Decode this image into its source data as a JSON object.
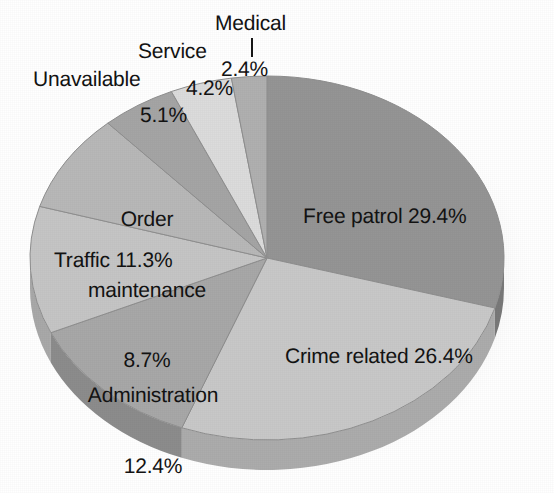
{
  "chart_data": {
    "type": "pie",
    "title": "",
    "subtitle": "",
    "xlabel": "",
    "ylabel": "",
    "legend_position": "none",
    "grid": false,
    "value_unit": "percent",
    "labels": [
      "Free patrol",
      "Crime related",
      "Administration",
      "Traffic",
      "Order maintenance",
      "Unavailable",
      "Service",
      "Medical"
    ],
    "values": [
      29.4,
      26.4,
      12.4,
      11.3,
      8.7,
      5.1,
      4.2,
      2.4
    ],
    "value_labels": [
      "29.4%",
      "26.4%",
      "12.4%",
      "11.3%",
      "8.7%",
      "5.1%",
      "4.2%",
      "2.4%"
    ],
    "colors": [
      "#959595",
      "#c8c8c8",
      "#a8a8a8",
      "#c5c5c5",
      "#b8b8b8",
      "#a5a5a5",
      "#dcdcdc",
      "#b0b0b0"
    ],
    "start_angle_deg": 0,
    "direction": "clockwise",
    "style": "3d-elliptical",
    "background": "#ffffff",
    "text_color": "#131313"
  },
  "slice_labels": {
    "free_patrol": "Free patrol 29.4%",
    "crime_related": "Crime related 26.4%",
    "administration_name": "Administration",
    "administration_pct": "12.4%",
    "traffic": "Traffic 11.3%",
    "order_line1": "Order",
    "order_line2": "maintenance",
    "order_pct": "8.7%",
    "unavailable_name": "Unavailable",
    "unavailable_pct": "5.1%",
    "service_name": "Service",
    "service_pct": "4.2%",
    "medical_name": "Medical",
    "medical_pct": "2.4%"
  },
  "geometry": {
    "center_x": 267,
    "center_y": 258,
    "radius_x": 237,
    "radius_y": 182,
    "depth": 30
  }
}
